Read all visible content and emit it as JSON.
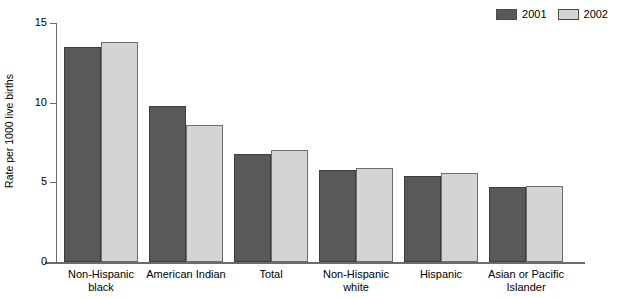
{
  "chart_data": {
    "type": "bar",
    "title": "",
    "xlabel": "",
    "ylabel": "Rate per 1000 live births",
    "ylim": [
      0,
      15
    ],
    "yticks": [
      0,
      5,
      10,
      15
    ],
    "grid": false,
    "legend_position": "top-right",
    "categories": [
      "Non-Hispanic black",
      "American Indian",
      "Total",
      "Non-Hispanic white",
      "Hispanic",
      "Asian or Pacific Islander"
    ],
    "category_lines": [
      [
        "Non-Hispanic",
        "black"
      ],
      [
        "American Indian"
      ],
      [
        "Total"
      ],
      [
        "Non-Hispanic",
        "white"
      ],
      [
        "Hispanic"
      ],
      [
        "Asian or Pacific",
        "Islander"
      ]
    ],
    "series": [
      {
        "name": "2001",
        "color": "#595959",
        "values": [
          13.5,
          9.8,
          6.8,
          5.8,
          5.4,
          4.7
        ]
      },
      {
        "name": "2002",
        "color": "#d4d4d4",
        "values": [
          13.8,
          8.6,
          7.0,
          5.9,
          5.6,
          4.8
        ]
      }
    ]
  },
  "axis": {
    "tick_labels": [
      "15",
      "10",
      "5",
      "0"
    ],
    "y_title": "Rate per 1000 live births"
  },
  "legend": {
    "entries": [
      {
        "label": "2001",
        "color": "#595959"
      },
      {
        "label": "2002",
        "color": "#d4d4d4"
      }
    ]
  }
}
